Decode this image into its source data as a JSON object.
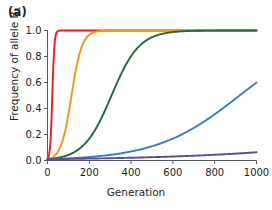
{
  "figure": {
    "panel_label": "(a)",
    "background_color": "#ffffff",
    "text_color": "#231f20",
    "axis_color": "#58595b"
  },
  "chart_data": {
    "type": "line",
    "title": "",
    "subtitle": "",
    "xlabel": "Generation",
    "ylabel": "Frequency of allele B",
    "ylabel_subscript": "1",
    "xlim": [
      0,
      1000
    ],
    "ylim": [
      0.0,
      1.0
    ],
    "xticks": [
      0,
      200,
      400,
      600,
      800,
      1000
    ],
    "xticklabels": [
      "0",
      "200",
      "400",
      "600",
      "800",
      "1000"
    ],
    "yticks": [
      0.0,
      0.2,
      0.4,
      0.6,
      0.8,
      1.0
    ],
    "yticklabels": [
      "0.0",
      "0.2",
      "0.4",
      "0.6",
      "0.8",
      "1.0"
    ],
    "grid": false,
    "legend": false,
    "legend_position": "none",
    "initial_frequency": 0.01,
    "x": [
      0,
      50,
      100,
      150,
      200,
      250,
      300,
      350,
      400,
      450,
      500,
      550,
      600,
      650,
      700,
      750,
      800,
      850,
      900,
      950,
      1000
    ],
    "series": [
      {
        "name": "red-curve",
        "color": "#ed1c24",
        "selection_coefficient": 0.2,
        "values": [
          0.01,
          0.69,
          0.985,
          0.9994,
          1.0,
          1.0,
          1.0,
          1.0,
          1.0,
          1.0,
          1.0,
          1.0,
          1.0,
          1.0,
          1.0,
          1.0,
          1.0,
          1.0,
          1.0,
          1.0,
          1.0
        ]
      },
      {
        "name": "orange-curve",
        "color": "#f7941e",
        "selection_coefficient": 0.04,
        "values": [
          0.01,
          0.069,
          0.352,
          0.771,
          0.945,
          0.988,
          0.9976,
          0.9995,
          0.9999,
          1.0,
          1.0,
          1.0,
          1.0,
          1.0,
          1.0,
          1.0,
          1.0,
          1.0,
          1.0,
          1.0,
          1.0
        ]
      },
      {
        "name": "green-curve",
        "color": "#1d6b3f",
        "selection_coefficient": 0.015,
        "values": [
          0.01,
          0.021,
          0.043,
          0.088,
          0.17,
          0.303,
          0.477,
          0.655,
          0.796,
          0.888,
          0.941,
          0.969,
          0.984,
          0.992,
          0.996,
          0.998,
          0.999,
          0.9995,
          0.9998,
          0.9999,
          1.0
        ]
      },
      {
        "name": "blue-curve",
        "color": "#3b7cc4",
        "selection_coefficient": 0.005,
        "values": [
          0.01,
          0.013,
          0.016,
          0.021,
          0.027,
          0.034,
          0.043,
          0.055,
          0.07,
          0.088,
          0.111,
          0.138,
          0.171,
          0.21,
          0.256,
          0.308,
          0.365,
          0.426,
          0.489,
          0.551,
          0.61
        ]
      },
      {
        "name": "purple-curve",
        "color": "#5b4b9b",
        "selection_coefficient": 0.0019,
        "values": [
          0.01,
          0.011,
          0.012,
          0.013,
          0.015,
          0.016,
          0.018,
          0.02,
          0.022,
          0.024,
          0.026,
          0.028,
          0.031,
          0.034,
          0.037,
          0.041,
          0.045,
          0.049,
          0.054,
          0.059,
          0.065
        ]
      }
    ]
  }
}
